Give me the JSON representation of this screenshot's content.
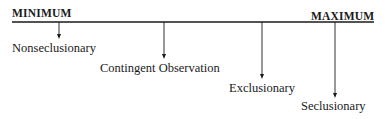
{
  "diagram": {
    "scale_left_label": "MINIMUM",
    "scale_right_label": "MAXIMUM",
    "points": [
      {
        "label": "Nonseclusionary"
      },
      {
        "label": "Contingent Observation"
      },
      {
        "label": "Exclusionary"
      },
      {
        "label": "Seclusionary"
      }
    ],
    "colors": {
      "line": "#1a1a1a",
      "text": "#1a1a1a",
      "background": "#ffffff"
    }
  }
}
